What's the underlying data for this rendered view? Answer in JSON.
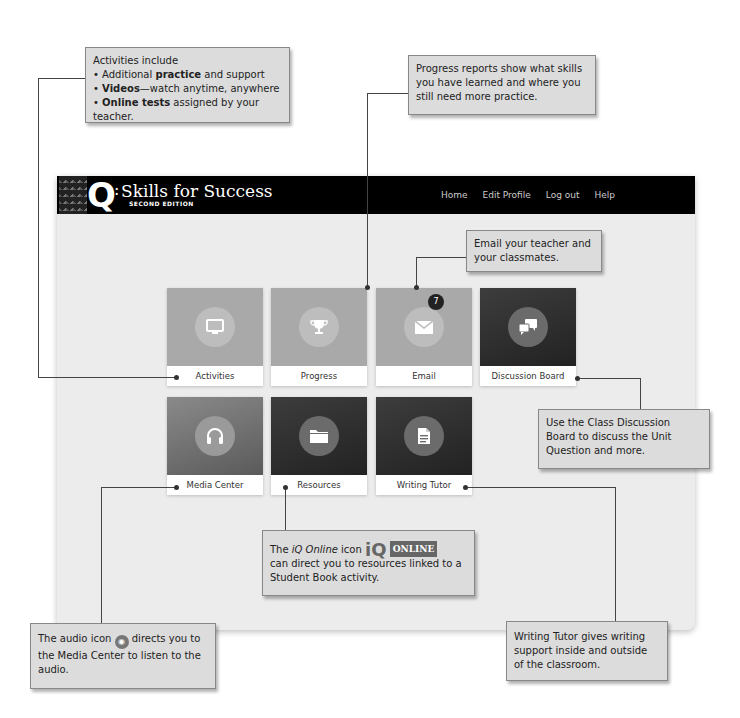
{
  "app": {
    "logo": {
      "letter": "Q",
      "colon": ":",
      "title": "Skills for Success",
      "subtitle": "SECOND EDITION"
    },
    "nav": [
      {
        "label": "Home"
      },
      {
        "label": "Edit Profile"
      },
      {
        "label": "Log out"
      },
      {
        "label": "Help"
      }
    ],
    "tiles": [
      {
        "label": "Activities",
        "icon": "monitor-icon"
      },
      {
        "label": "Progress",
        "icon": "trophy-icon"
      },
      {
        "label": "Email",
        "icon": "envelope-icon",
        "badge": "7"
      },
      {
        "label": "Discussion Board",
        "icon": "chat-bubbles-icon"
      },
      {
        "label": "Media Center",
        "icon": "headphones-icon"
      },
      {
        "label": "Resources",
        "icon": "folder-icon"
      },
      {
        "label": "Writing Tutor",
        "icon": "document-icon"
      }
    ]
  },
  "callouts": {
    "activities": {
      "heading": "Activities include",
      "items": [
        {
          "bold": "",
          "pre": "Additional ",
          "strong": "practice",
          "post": " and support"
        },
        {
          "strong": "Videos",
          "post": "—watch anytime, anywhere"
        },
        {
          "strong": "Online tests",
          "post": " assigned by your teacher."
        }
      ]
    },
    "progress": {
      "text": "Progress reports show what skills you have learned and where you still need more practice."
    },
    "email": {
      "text": "Email your teacher and your classmates."
    },
    "discussion": {
      "text": "Use the Class Discussion Board to discuss the Unit Question and more."
    },
    "iq_online": {
      "pre": "The ",
      "italic": "iQ Online",
      "mid": " icon ",
      "logo": "iQ",
      "logo_badge": "ONLINE",
      "post": "can direct you to resources linked to a Student Book activity."
    },
    "audio": {
      "pre": "The audio icon ",
      "icon": "◉",
      "post": " directs you to the Media Center to listen to the audio."
    },
    "writing_tutor": {
      "text": "Writing Tutor gives writing support inside and outside of the classroom."
    }
  }
}
